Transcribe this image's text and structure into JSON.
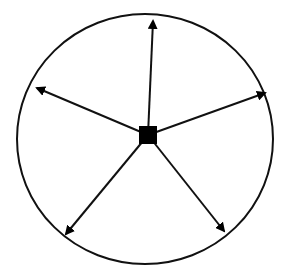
{
  "diagram": {
    "colors": {
      "stroke": "#111111",
      "fill": "#000000",
      "background": "#ffffff"
    },
    "boundary": {
      "shape": "ellipse",
      "cx": 145,
      "cy": 139,
      "rx": 128,
      "ry": 125
    },
    "center_node": {
      "shape": "square",
      "cx": 148,
      "cy": 135,
      "size": 18
    },
    "arrows": [
      {
        "id": "up",
        "x2": 153,
        "y2": 21
      },
      {
        "id": "upper-left",
        "x2": 37,
        "y2": 88
      },
      {
        "id": "upper-right",
        "x2": 265,
        "y2": 93
      },
      {
        "id": "lower-left",
        "x2": 66,
        "y2": 234
      },
      {
        "id": "lower-right",
        "x2": 224,
        "y2": 231
      }
    ]
  }
}
